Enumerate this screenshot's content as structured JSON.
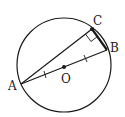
{
  "diagram": {
    "type": "geometry",
    "colors": {
      "stroke": "#1a1a1a",
      "background": "#ffffff"
    },
    "circle": {
      "cx": 64,
      "cy": 65,
      "r": 47,
      "center_label": "O"
    },
    "points": {
      "A": {
        "label": "A",
        "x": 21,
        "y": 84
      },
      "B": {
        "label": "B",
        "x": 107,
        "y": 50
      },
      "C": {
        "label": "C",
        "x": 92,
        "y": 29
      },
      "O": {
        "label": "O",
        "x": 64,
        "y": 67
      }
    },
    "segments": [
      "AB",
      "AC",
      "CB"
    ],
    "marks": {
      "right_angle_at": "C",
      "equal_ticks": [
        "AO",
        "OB"
      ],
      "angle_tick_at": "A"
    }
  }
}
